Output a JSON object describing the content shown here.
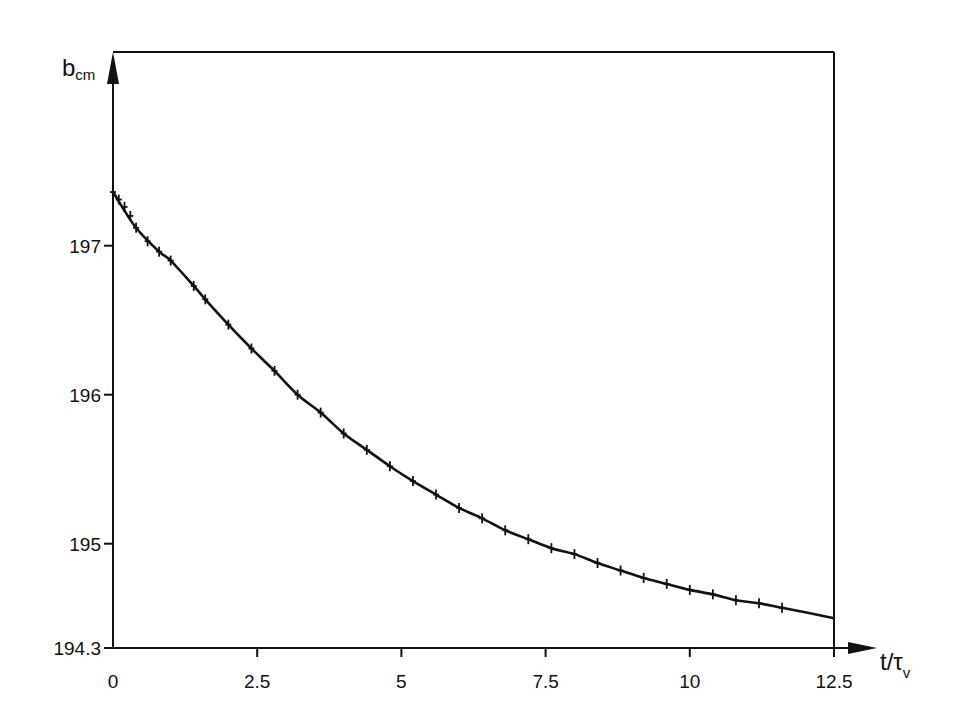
{
  "chart_data": {
    "type": "line",
    "title": "",
    "xlabel": "t/τ",
    "xlabel_sub": "v",
    "ylabel": "b",
    "ylabel_sub": "cm",
    "xlim": [
      0,
      12.5
    ],
    "ylim": [
      194.3,
      198.3
    ],
    "grid": false,
    "legend": "none",
    "x_ticks": [
      {
        "value": 0,
        "label": "0"
      },
      {
        "value": 2.5,
        "label": "2.5"
      },
      {
        "value": 5,
        "label": "5"
      },
      {
        "value": 7.5,
        "label": "7.5"
      },
      {
        "value": 10,
        "label": "10"
      },
      {
        "value": 12.5,
        "label": "12.5"
      }
    ],
    "y_ticks": [
      {
        "value": 194.3,
        "label": "194.3"
      },
      {
        "value": 195,
        "label": "195"
      },
      {
        "value": 196,
        "label": "196"
      },
      {
        "value": 197,
        "label": "197"
      }
    ],
    "series": [
      {
        "name": "b_cm curve",
        "style": "line",
        "x": [
          0,
          0.4,
          0.8,
          1.0,
          1.4,
          1.6,
          2.0,
          2.4,
          2.8,
          3.2,
          3.6,
          4.0,
          4.4,
          4.8,
          5.2,
          5.6,
          6.0,
          6.4,
          6.8,
          7.2,
          7.6,
          8.0,
          8.4,
          8.8,
          9.2,
          9.6,
          10.0,
          10.4,
          10.8,
          11.2,
          11.6,
          12.0,
          12.5
        ],
        "y": [
          197.36,
          197.12,
          196.96,
          196.9,
          196.73,
          196.64,
          196.47,
          196.31,
          196.16,
          196.0,
          195.88,
          195.74,
          195.63,
          195.52,
          195.42,
          195.33,
          195.24,
          195.17,
          195.09,
          195.03,
          194.97,
          194.93,
          194.87,
          194.82,
          194.77,
          194.73,
          194.69,
          194.66,
          194.62,
          194.6,
          194.57,
          194.54,
          194.5
        ]
      },
      {
        "name": "data markers",
        "style": "tick-marker",
        "x": [
          0,
          0.1,
          0.2,
          0.3,
          0.4,
          0.6,
          0.8,
          1.0,
          1.4,
          1.6,
          2.0,
          2.4,
          2.8,
          3.2,
          3.6,
          4.0,
          4.4,
          4.8,
          5.2,
          5.6,
          6.0,
          6.4,
          6.8,
          7.2,
          7.6,
          8.0,
          8.4,
          8.8,
          9.2,
          9.6,
          10.0,
          10.4,
          10.8,
          11.2,
          11.6
        ],
        "y": [
          197.36,
          197.31,
          197.26,
          197.2,
          197.12,
          197.03,
          196.96,
          196.9,
          196.73,
          196.64,
          196.47,
          196.31,
          196.16,
          196.0,
          195.88,
          195.74,
          195.63,
          195.52,
          195.42,
          195.33,
          195.24,
          195.17,
          195.09,
          195.03,
          194.97,
          194.93,
          194.87,
          194.82,
          194.77,
          194.73,
          194.69,
          194.66,
          194.62,
          194.6,
          194.57
        ]
      }
    ]
  }
}
